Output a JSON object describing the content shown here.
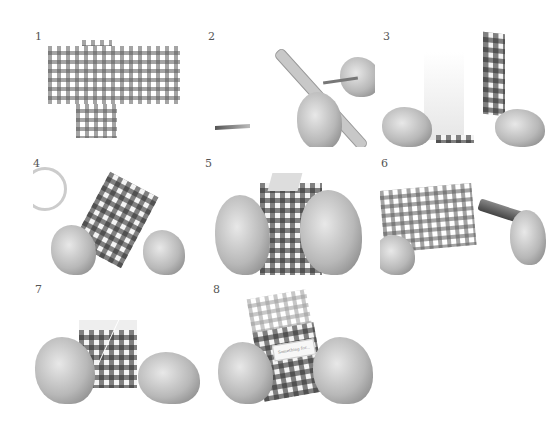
{
  "steps": [
    {
      "number": "1",
      "description": "gingham box template cut-out"
    },
    {
      "number": "2",
      "description": "scoring fold lines with ruler"
    },
    {
      "number": "3",
      "description": "folding the sides"
    },
    {
      "number": "4",
      "description": "applying double-sided tape"
    },
    {
      "number": "5",
      "description": "folding the top flaps"
    },
    {
      "number": "6",
      "description": "punching holes"
    },
    {
      "number": "7",
      "description": "tying string around box"
    },
    {
      "number": "8",
      "description": "attaching label tag"
    }
  ],
  "step8_label_text": "Something for..."
}
